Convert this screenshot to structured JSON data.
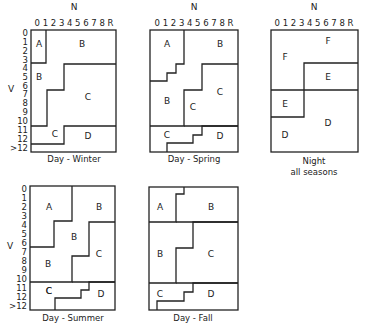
{
  "axis": {
    "n_label": "N",
    "v_label": "V",
    "n_ticks": "0 1 2 3 4 5 6 7 8 R",
    "v_ticks": [
      "0",
      "1",
      "2",
      "3",
      "4",
      "5",
      "6",
      "7",
      "8",
      "9",
      "10",
      "11",
      "12",
      ">12"
    ]
  },
  "panels": [
    {
      "id": "winter",
      "caption": "Day - Winter",
      "regions": [
        {
          "label": "A",
          "x": 39,
          "y": 47
        },
        {
          "label": "B",
          "x": 82,
          "y": 47
        },
        {
          "label": "B",
          "x": 39,
          "y": 80
        },
        {
          "label": "C",
          "x": 88,
          "y": 100
        },
        {
          "label": "C",
          "x": 55,
          "y": 137
        },
        {
          "label": "D",
          "x": 88,
          "y": 139
        }
      ]
    },
    {
      "id": "spring",
      "caption": "Day - Spring",
      "regions": [
        {
          "label": "A",
          "x": 167,
          "y": 47
        },
        {
          "label": "B",
          "x": 220,
          "y": 47
        },
        {
          "label": "B",
          "x": 167,
          "y": 104
        },
        {
          "label": "C",
          "x": 193,
          "y": 110
        },
        {
          "label": "C",
          "x": 220,
          "y": 95
        },
        {
          "label": "C",
          "x": 167,
          "y": 138
        },
        {
          "label": "D",
          "x": 220,
          "y": 139
        }
      ]
    },
    {
      "id": "night",
      "caption": "Night",
      "caption2": "all seasons",
      "regions": [
        {
          "label": "F",
          "x": 328,
          "y": 44
        },
        {
          "label": "F",
          "x": 285,
          "y": 60
        },
        {
          "label": "E",
          "x": 328,
          "y": 78
        },
        {
          "label": "E",
          "x": 285,
          "y": 105
        },
        {
          "label": "D",
          "x": 328,
          "y": 124
        },
        {
          "label": "D",
          "x": 285,
          "y": 136
        }
      ]
    },
    {
      "id": "summer",
      "caption": "Day - Summer",
      "regions": [
        {
          "label": "A",
          "x": 48,
          "y": 206
        },
        {
          "label": "B",
          "x": 98,
          "y": 206
        },
        {
          "label": "B",
          "x": 73,
          "y": 236
        },
        {
          "label": "C",
          "x": 98,
          "y": 254
        },
        {
          "label": "B",
          "x": 48,
          "y": 265
        },
        {
          "label": "C",
          "x": 48,
          "y": 294
        },
        {
          "label": "D",
          "x": 100,
          "y": 297
        }
      ]
    },
    {
      "id": "fall",
      "caption": "Day - Fall",
      "regions": [
        {
          "label": "A",
          "x": 160,
          "y": 206
        },
        {
          "label": "B",
          "x": 211,
          "y": 206
        },
        {
          "label": "B",
          "x": 160,
          "y": 254
        },
        {
          "label": "C",
          "x": 211,
          "y": 254
        },
        {
          "label": "C",
          "x": 160,
          "y": 295
        },
        {
          "label": "D",
          "x": 211,
          "y": 297
        }
      ]
    }
  ]
}
